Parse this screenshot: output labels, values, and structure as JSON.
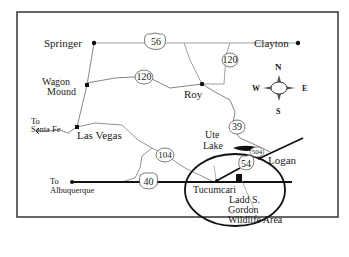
{
  "map": {
    "title": "Northeastern New Mexico road map",
    "cities": [
      {
        "name": "Springer"
      },
      {
        "name": "Clayton"
      },
      {
        "name": "Wagon Mound"
      },
      {
        "name": "Roy"
      },
      {
        "name": "Las Vegas"
      },
      {
        "name": "Logan"
      },
      {
        "name": "Tucumcari"
      }
    ],
    "labels": {
      "springer": "Springer",
      "clayton": "Clayton",
      "wagon": "Wagon",
      "mound": "Mound",
      "roy": "Roy",
      "to_sf_1": "To",
      "to_sf_2": "Santa Fe",
      "las_vegas": "Las Vegas",
      "ute": "Ute",
      "lake": "Lake",
      "logan": "Logan",
      "to_alb_1": "To",
      "to_alb_2": "Albuquerque",
      "tucumcari": "Tucumcari",
      "ladd": "Ladd S.",
      "gordon": "Gordon",
      "wildlife": "Wildlife Area"
    },
    "routes": {
      "r56": "56",
      "r120a": "120",
      "r120b": "120",
      "r39": "39",
      "r504": "504",
      "r54": "54",
      "r104": "104",
      "r40": "40"
    },
    "compass": {
      "n": "N",
      "s": "S",
      "e": "E",
      "w": "W"
    }
  }
}
